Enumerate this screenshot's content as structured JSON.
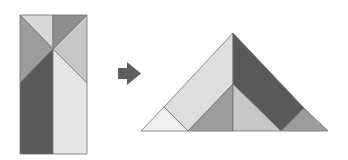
{
  "diagram": {
    "colors": {
      "dark": "#595959",
      "medium_dark": "#8f8f8f",
      "medium": "#9c9c9c",
      "light_medium": "#c7c7c7",
      "light": "#d8d8d8",
      "lightest": "#e6e6e6",
      "palest": "#f0f0f0",
      "arrow": "#5e5e5e"
    },
    "source_shape": {
      "name": "rectangle",
      "pieces": [
        {
          "id": "top-left-triangle",
          "points": "20,15 53,15 53,49",
          "color": "#d8d8d8"
        },
        {
          "id": "top-right-triangle",
          "points": "53,15 87,15 53,49",
          "color": "#8f8f8f"
        },
        {
          "id": "left-triangle",
          "points": "20,15 53,49 20,83",
          "color": "#9c9c9c"
        },
        {
          "id": "right-triangle",
          "points": "87,15 53,49 87,83",
          "color": "#c7c7c7"
        },
        {
          "id": "left-dark-quad",
          "points": "20,83 53,49 53,154 20,154",
          "color": "#595959"
        },
        {
          "id": "right-light-quad",
          "points": "53,49 87,83 87,154 53,154",
          "color": "#e6e6e6"
        }
      ]
    },
    "arrow": {
      "direction": "right",
      "points": "118,68 127,68 127,62 141,73.5 127,85 127,79 118,79"
    },
    "target_shape": {
      "name": "triangle",
      "pieces": [
        {
          "id": "left-parallelogram",
          "points": "164,107 233,33 233,84 188,131",
          "color": "#dedede"
        },
        {
          "id": "right-dark-parallelogram",
          "points": "233,33 304,108 281,131 233,84",
          "color": "#595959"
        },
        {
          "id": "bottom-left-small-triangle",
          "points": "141,131 164,107 188,131",
          "color": "#f0f0f0"
        },
        {
          "id": "inner-left-triangle",
          "points": "233,84 188,131 233,131",
          "color": "#9c9c9c"
        },
        {
          "id": "inner-right-triangle",
          "points": "233,84 281,131 233,131",
          "color": "#c7c7c7"
        },
        {
          "id": "bottom-right-small-triangle",
          "points": "281,131 304,108 328,131",
          "color": "#9c9c9c"
        }
      ]
    }
  }
}
